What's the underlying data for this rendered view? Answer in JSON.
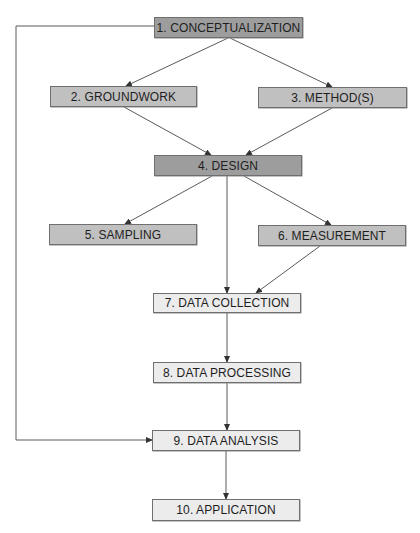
{
  "diagram": {
    "type": "flowchart",
    "nodes": [
      {
        "id": 1,
        "label": "1. CONCEPTUALIZATION",
        "shade": "dark"
      },
      {
        "id": 2,
        "label": "2. GROUNDWORK",
        "shade": "mid"
      },
      {
        "id": 3,
        "label": "3. METHOD(S)",
        "shade": "mid"
      },
      {
        "id": 4,
        "label": "4. DESIGN",
        "shade": "dark"
      },
      {
        "id": 5,
        "label": "5. SAMPLING",
        "shade": "mid"
      },
      {
        "id": 6,
        "label": "6. MEASUREMENT",
        "shade": "mid"
      },
      {
        "id": 7,
        "label": "7. DATA COLLECTION",
        "shade": "light"
      },
      {
        "id": 8,
        "label": "8. DATA PROCESSING",
        "shade": "light"
      },
      {
        "id": 9,
        "label": "9. DATA ANALYSIS",
        "shade": "light"
      },
      {
        "id": 10,
        "label": "10. APPLICATION",
        "shade": "light"
      }
    ],
    "edges": [
      {
        "from": 1,
        "to": 2
      },
      {
        "from": 1,
        "to": 3
      },
      {
        "from": 2,
        "to": 4
      },
      {
        "from": 3,
        "to": 4
      },
      {
        "from": 4,
        "to": 5
      },
      {
        "from": 4,
        "to": 6
      },
      {
        "from": 4,
        "to": 7
      },
      {
        "from": 6,
        "to": 7
      },
      {
        "from": 7,
        "to": 8
      },
      {
        "from": 8,
        "to": 9
      },
      {
        "from": 9,
        "to": 10
      },
      {
        "from": 1,
        "to": 9,
        "route": "left-feedback"
      }
    ],
    "colors": {
      "dark": "#9d9d9d",
      "mid": "#c0c0c0",
      "light": "#ececec",
      "line": "#555555"
    }
  }
}
